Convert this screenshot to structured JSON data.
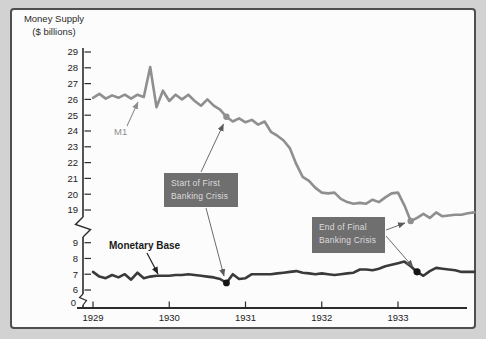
{
  "chart_data": {
    "type": "line",
    "title": "Money Supply",
    "subtitle": "($ billions)",
    "xlabel": "",
    "ylabel": "",
    "x_unit": "year, monthly points",
    "x_range": [
      1929,
      1934
    ],
    "xticks": [
      1929,
      1930,
      1931,
      1932,
      1933
    ],
    "y_axis_break": true,
    "yticks_upper": [
      29,
      28,
      27,
      26,
      25,
      24,
      23,
      22,
      21,
      20,
      19
    ],
    "yticks_lower": [
      9,
      8,
      7,
      6
    ],
    "origin_label": "0",
    "grid": false,
    "legend": "inline labels with arrows",
    "series": [
      {
        "name": "M1",
        "scale": "upper",
        "color_key": "m1",
        "x_start": 1929,
        "step_months": 1,
        "values": [
          26.1,
          26.35,
          26.05,
          26.25,
          26.1,
          26.3,
          26.05,
          26.3,
          26.15,
          28.05,
          25.5,
          26.55,
          25.9,
          26.3,
          26.0,
          26.3,
          25.9,
          25.6,
          26.0,
          25.6,
          25.35,
          24.9,
          24.6,
          24.8,
          24.55,
          24.7,
          24.4,
          24.6,
          23.95,
          23.7,
          23.4,
          22.9,
          21.9,
          21.1,
          20.85,
          20.4,
          20.1,
          20.05,
          20.1,
          19.7,
          19.5,
          19.4,
          19.45,
          19.4,
          19.65,
          19.5,
          19.8,
          20.05,
          20.1,
          19.3,
          18.3,
          18.5,
          18.75,
          18.5,
          18.85,
          18.6,
          18.65,
          18.7,
          18.7,
          18.8,
          18.85
        ]
      },
      {
        "name": "Monetary Base",
        "scale": "lower",
        "color_key": "monetary_base",
        "x_start": 1929,
        "step_months": 1,
        "values": [
          7.15,
          6.85,
          6.75,
          6.95,
          6.8,
          7.0,
          6.65,
          7.1,
          6.75,
          6.85,
          6.9,
          6.9,
          6.9,
          6.95,
          6.95,
          7.0,
          6.95,
          6.9,
          6.85,
          6.8,
          6.7,
          6.45,
          7.0,
          6.7,
          6.75,
          7.0,
          7.0,
          7.0,
          7.0,
          7.05,
          7.1,
          7.15,
          7.2,
          7.1,
          7.05,
          7.0,
          7.05,
          7.0,
          6.95,
          7.0,
          7.05,
          7.1,
          7.3,
          7.3,
          7.25,
          7.35,
          7.5,
          7.6,
          7.7,
          7.8,
          7.5,
          7.15,
          6.9,
          7.2,
          7.4,
          7.35,
          7.3,
          7.25,
          7.15,
          7.15,
          7.15
        ]
      }
    ],
    "markers": [
      {
        "name": "start-crisis-m1-dot",
        "year": 1930.75,
        "value": 24.9,
        "scale": "upper",
        "color_key": "m1",
        "r": 3.2
      },
      {
        "name": "start-crisis-base-dot",
        "year": 1930.75,
        "value": 6.45,
        "scale": "lower",
        "color_key": "dot_black",
        "r": 3.4
      },
      {
        "name": "end-crisis-m1-dot",
        "year": 1933.1667,
        "value": 18.3,
        "scale": "upper",
        "color_key": "m1",
        "r": 3.2
      },
      {
        "name": "end-crisis-base-dot",
        "year": 1933.25,
        "value": 7.15,
        "scale": "lower",
        "color_key": "dot_black",
        "r": 3.6
      }
    ],
    "annotations": [
      {
        "id": "start-banking-crisis",
        "line1": "Start of First",
        "line2": "Banking Crisis"
      },
      {
        "id": "end-banking-crisis",
        "line1": "End of Final",
        "line2": "Banking Crisis"
      }
    ],
    "colors": {
      "page_bg": "#d2d2d2",
      "figure_bg": "#fcfcfc",
      "frame": "#4f4f4f",
      "axis": "#2b2b2b",
      "tick_label": "#222222",
      "m1": "#8f8f8f",
      "monetary_base": "#3a3a3a",
      "dot_black": "#151515",
      "arrow": "#5a5a5a",
      "annotation_bg": "#6f6f6f",
      "annotation_fg": "#dcdcdc",
      "title_fg": "#2b2b2b"
    }
  }
}
